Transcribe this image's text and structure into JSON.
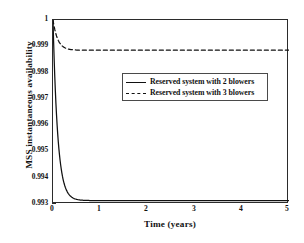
{
  "chart_data": {
    "type": "line",
    "title": "",
    "xlabel": "Time (years)",
    "ylabel": "MSS instantaneous availability",
    "xlim": [
      0,
      5
    ],
    "ylim": [
      0.993,
      1
    ],
    "grid": false,
    "legend_position": "upper-center-right",
    "xticks": [
      "0",
      "1",
      "2",
      "3",
      "4",
      "5"
    ],
    "xtick_values": [
      0,
      1,
      2,
      3,
      4,
      5
    ],
    "yticks": [
      "0.993",
      "0.994",
      "0.995",
      "0.996",
      "0.997",
      "0.998",
      "0.999",
      "1"
    ],
    "ytick_values": [
      0.993,
      0.994,
      0.995,
      0.996,
      0.997,
      0.998,
      0.999,
      1.0
    ],
    "series": [
      {
        "name": "Reserved system with 2 blowers",
        "style": "solid",
        "color": "#111111",
        "initial_value": 1.0,
        "steady_state": 0.99313,
        "time_constant_years": 0.1,
        "x": [
          0,
          0.05,
          0.1,
          0.15,
          0.2,
          0.25,
          0.3,
          0.35,
          0.4,
          0.5,
          0.6,
          0.7,
          0.8,
          1,
          1.5,
          2,
          2.5,
          3,
          3.5,
          4,
          4.5,
          5
        ],
        "y": [
          1.0,
          0.99729,
          0.99566,
          0.99467,
          0.99407,
          0.9937,
          0.99348,
          0.99335,
          0.99327,
          0.99319,
          0.99315,
          0.99314,
          0.99313,
          0.99313,
          0.99313,
          0.99313,
          0.99313,
          0.99313,
          0.99313,
          0.99313,
          0.99313,
          0.99313
        ]
      },
      {
        "name": "Reserved system with 3 blowers",
        "style": "dashed",
        "color": "#111111",
        "initial_value": 1.0,
        "steady_state": 0.99885,
        "time_constant_years": 0.1,
        "x": [
          0,
          0.05,
          0.1,
          0.15,
          0.2,
          0.25,
          0.3,
          0.35,
          0.4,
          0.5,
          0.6,
          0.7,
          0.8,
          1,
          1.5,
          2,
          2.5,
          3,
          3.5,
          4,
          4.5,
          5
        ],
        "y": [
          1.0,
          0.99955,
          0.99927,
          0.99911,
          0.999,
          0.99894,
          0.99891,
          0.99889,
          0.99887,
          0.99886,
          0.99885,
          0.99885,
          0.99885,
          0.99885,
          0.99885,
          0.99885,
          0.99885,
          0.99885,
          0.99885,
          0.99885,
          0.99885,
          0.99885
        ]
      }
    ]
  },
  "legend": {
    "entries": [
      {
        "label": "Reserved system with 2 blowers",
        "style": "solid"
      },
      {
        "label": "Reserved system with 3 blowers",
        "style": "dashed"
      }
    ]
  },
  "axes": {
    "x_title": "Time (years)",
    "y_title": "MSS instantaneous availability"
  },
  "colors": {
    "line": "#111111",
    "frame": "#2b2b2b",
    "background": "#ffffff"
  }
}
